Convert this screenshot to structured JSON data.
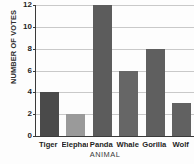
{
  "chart_data": {
    "type": "bar",
    "title": "",
    "xlabel": "ANIMAL",
    "ylabel": "NUMBER OF VOTES",
    "categories": [
      "Tiger",
      "Elephant",
      "Panda",
      "Whale",
      "Gorilla",
      "Wolf"
    ],
    "values": [
      4,
      2,
      12,
      6,
      8,
      3
    ],
    "ylim": [
      0,
      12
    ],
    "ytick_labels": [
      "0",
      "2",
      "4",
      "6",
      "8",
      "10",
      "12"
    ],
    "ytick_values": [
      0,
      2,
      4,
      6,
      8,
      10,
      12
    ],
    "grid": true,
    "grid_axis": "y",
    "legend": false,
    "bar_colors": [
      "#4a4a4a",
      "#9a9a9a",
      "#5c5c5c",
      "#666666",
      "#5f5f5f",
      "#616161"
    ],
    "colors": {
      "axis": "#3a3a3a",
      "gridline": "#c9c9c9",
      "background": "#fdfdfd",
      "tick_text": "#1f1f1f",
      "axis_title": "#2e2e2e"
    }
  }
}
